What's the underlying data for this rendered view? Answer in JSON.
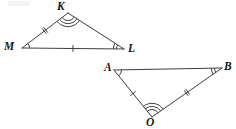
{
  "figure": {
    "type": "geometry-diagram",
    "stroke_color": "#3d3d3d",
    "label_color": "#161616",
    "background_color": "#ffffff",
    "stroke_width": 1,
    "triangles": [
      {
        "name": "triangle-KML",
        "vertices": [
          {
            "id": "K",
            "label": "K",
            "x": 68,
            "y": 13,
            "label_x": 57,
            "label_y": 1,
            "angle_marks": 3
          },
          {
            "id": "M",
            "label": "M",
            "x": 22,
            "y": 48,
            "label_x": 4,
            "label_y": 41,
            "angle_marks": 1
          },
          {
            "id": "L",
            "label": "L",
            "x": 124,
            "y": 49,
            "label_x": 128,
            "label_y": 43,
            "angle_marks": 2
          }
        ],
        "sides": [
          {
            "id": "MK",
            "from": "M",
            "to": "K",
            "tick_marks": 2
          },
          {
            "id": "KL",
            "from": "K",
            "to": "L",
            "tick_marks": 0
          },
          {
            "id": "ML",
            "from": "M",
            "to": "L",
            "tick_marks": 1
          }
        ]
      },
      {
        "name": "triangle-ABO",
        "vertices": [
          {
            "id": "A",
            "label": "A",
            "x": 114,
            "y": 70,
            "label_x": 104,
            "label_y": 62,
            "angle_marks": 1
          },
          {
            "id": "B",
            "label": "B",
            "x": 222,
            "y": 68,
            "label_x": 224,
            "label_y": 61,
            "angle_marks": 2
          },
          {
            "id": "O",
            "label": "O",
            "x": 152,
            "y": 117,
            "label_x": 146,
            "label_y": 117,
            "angle_marks": 3
          }
        ],
        "sides": [
          {
            "id": "AB",
            "from": "A",
            "to": "B",
            "tick_marks": 0
          },
          {
            "id": "AO",
            "from": "A",
            "to": "O",
            "tick_marks": 1
          },
          {
            "id": "OB",
            "from": "O",
            "to": "B",
            "tick_marks": 2
          }
        ]
      }
    ]
  }
}
